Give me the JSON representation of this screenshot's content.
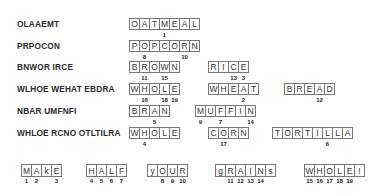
{
  "puzzle": {
    "rows": [
      {
        "scrambled": "OLAAEMT",
        "y": 18,
        "words": [
          {
            "x": 129,
            "letters": [
              "O",
              "A",
              "T",
              "M",
              "E",
              "A",
              "L"
            ],
            "numbers": {
              "3": "1"
            }
          }
        ]
      },
      {
        "scrambled": "PRPOCON",
        "y": 40,
        "words": [
          {
            "x": 129,
            "letters": [
              "P",
              "O",
              "P",
              "C",
              "O",
              "R",
              "N"
            ],
            "numbers": {
              "1": "8",
              "5": "10"
            }
          }
        ]
      },
      {
        "scrambled": "BNWOR IRCE",
        "y": 61,
        "words": [
          {
            "x": 129,
            "letters": [
              "B",
              "R",
              "O",
              "W",
              "N"
            ],
            "numbers": {
              "1": "11",
              "3": "15"
            }
          },
          {
            "x": 208,
            "letters": [
              "R",
              "I",
              "C",
              "E"
            ],
            "numbers": {
              "2": "13",
              "3": "3"
            }
          }
        ]
      },
      {
        "scrambled": "WLHOE WEHAT EBDRA",
        "y": 83,
        "words": [
          {
            "x": 129,
            "letters": [
              "W",
              "H",
              "O",
              "L",
              "E"
            ],
            "numbers": {
              "1": "16",
              "3": "18",
              "4": "19"
            }
          },
          {
            "x": 208,
            "letters": [
              "W",
              "H",
              "E",
              "A",
              "T"
            ],
            "numbers": {
              "3": "2"
            }
          },
          {
            "x": 284,
            "letters": [
              "B",
              "R",
              "E",
              "A",
              "D"
            ],
            "numbers": {
              "3": "12"
            }
          }
        ]
      },
      {
        "scrambled": "NBAR UMFNFI",
        "y": 105,
        "words": [
          {
            "x": 129,
            "letters": [
              "B",
              "R",
              "A",
              "N"
            ],
            "numbers": {
              "2": "5"
            }
          },
          {
            "x": 195,
            "letters": [
              "M",
              "U",
              "F",
              "F",
              "I",
              "N"
            ],
            "numbers": {
              "0": "9",
              "2": "7",
              "5": "14"
            }
          }
        ]
      },
      {
        "scrambled": "WHLOE RCNO OTLTILRA",
        "y": 127,
        "words": [
          {
            "x": 129,
            "letters": [
              "W",
              "H",
              "O",
              "L",
              "E"
            ],
            "numbers": {
              "1": "4"
            }
          },
          {
            "x": 208,
            "letters": [
              "C",
              "O",
              "R",
              "N"
            ],
            "numbers": {
              "1": "17"
            }
          },
          {
            "x": 272,
            "letters": [
              "T",
              "O",
              "R",
              "T",
              "I",
              "L",
              "L",
              "A"
            ],
            "numbers": {
              "5": "6"
            }
          }
        ]
      }
    ],
    "answer": {
      "y": 164,
      "words": [
        {
          "x": 21,
          "letters": [
            "M",
            "A",
            "k",
            "E"
          ],
          "numbers": {
            "0": "1",
            "1": "2",
            "3": "3"
          }
        },
        {
          "x": 86,
          "letters": [
            "H",
            "A",
            "L",
            "F"
          ],
          "numbers": {
            "0": "4",
            "1": "5",
            "2": "6",
            "3": "7"
          }
        },
        {
          "x": 147,
          "letters": [
            "y",
            "O",
            "U",
            "R"
          ],
          "numbers": {
            "1": "8",
            "2": "9",
            "3": "10"
          }
        },
        {
          "x": 215,
          "letters": [
            "g",
            "R",
            "A",
            "I",
            "N",
            "s"
          ],
          "numbers": {
            "1": "11",
            "2": "12",
            "3": "13",
            "4": "14"
          }
        },
        {
          "x": 304,
          "letters": [
            "W",
            "H",
            "O",
            "L",
            "E",
            "!"
          ],
          "numbers": {
            "0": "15",
            "1": "16",
            "2": "17",
            "3": "18",
            "4": "19"
          }
        }
      ]
    }
  }
}
